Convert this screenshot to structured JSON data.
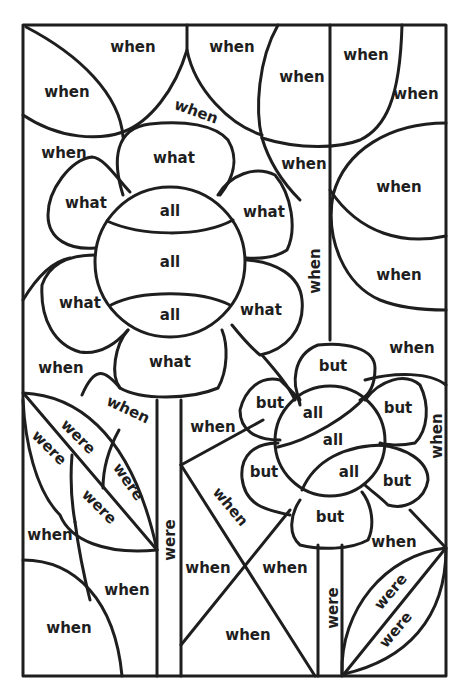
{
  "page": {
    "type": "color-by-sight-word worksheet",
    "words_present": [
      "when",
      "what",
      "all",
      "but",
      "were"
    ]
  },
  "labels": {
    "top_left_corner": "when",
    "top_left_leaf": "when",
    "top_center_left": "when",
    "top_center_arc": "when",
    "top_circle_left": "when",
    "top_circle_right": "when",
    "top_right_corner": "when",
    "right_upper_circle": "when",
    "right_lower_circle": "when",
    "right_mid_gap": "when",
    "center_gap_below_circle": "when",
    "left_above_flower": "when",
    "vertical_between": "when",
    "left_below_flower": "when",
    "stem_left_diag": "when",
    "middle_between_stems": "when",
    "x_left": "when",
    "x_right": "when",
    "x_bottom": "when",
    "x_top_diag": "when",
    "small_flower_right_vertical": "when",
    "small_flower_lower_right": "when",
    "bottom_left_quarter": "when",
    "bottom_left_upper": "when",
    "bottom_left_mid": "when",
    "big_petal_top": "what",
    "big_petal_upper_left": "what",
    "big_petal_upper_right": "what",
    "big_petal_lower_left": "what",
    "big_petal_lower_right": "what",
    "big_petal_bottom": "what",
    "big_center_top": "all",
    "big_center_middle": "all",
    "big_center_bottom": "all",
    "small_petal_top": "but",
    "small_petal_upper_left": "but",
    "small_petal_upper_right": "but",
    "small_petal_lower_left": "but",
    "small_petal_lower_right": "but",
    "small_petal_bottom": "but",
    "small_center_upper": "all",
    "small_center_middle": "all",
    "small_center_lower": "all",
    "leaf_left_1": "were",
    "leaf_left_2": "were",
    "leaf_left_3": "were",
    "leaf_left_4": "were",
    "stem_left": "were",
    "stem_right": "were",
    "leaf_right_1": "were",
    "leaf_right_2": "were"
  }
}
